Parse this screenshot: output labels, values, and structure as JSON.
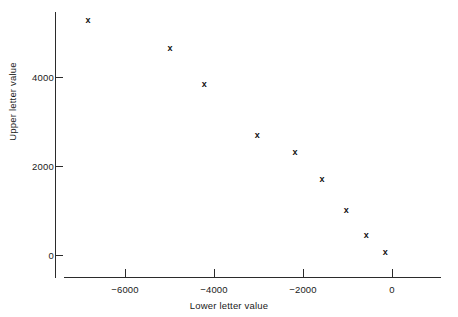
{
  "chart_data": {
    "type": "scatter",
    "title": "",
    "xlabel": "Lower letter value",
    "ylabel": "Upper letter value",
    "xlim": [
      -7450,
      1100
    ],
    "ylim": [
      -500,
      5960
    ],
    "xticks": [
      -6000,
      -4000,
      -2000,
      0
    ],
    "xticklabels": [
      "−6000",
      "−4000",
      "−2000",
      "0"
    ],
    "yticks": [
      0,
      2000,
      4000
    ],
    "yticklabels": [
      "0",
      "2000",
      "4000"
    ],
    "grid": false,
    "legend": null,
    "marker": "x",
    "marker_color": "#111111",
    "axis_color": "#2b2b2b",
    "background": "#ffffff",
    "points": [
      {
        "x": -6830,
        "y": 5280
      },
      {
        "x": -4990,
        "y": 4650
      },
      {
        "x": -4220,
        "y": 3840
      },
      {
        "x": -3030,
        "y": 2700
      },
      {
        "x": -2180,
        "y": 2310
      },
      {
        "x": -1570,
        "y": 1710
      },
      {
        "x": -1030,
        "y": 1010
      },
      {
        "x": -580,
        "y": 450
      },
      {
        "x": -150,
        "y": 70
      }
    ]
  }
}
